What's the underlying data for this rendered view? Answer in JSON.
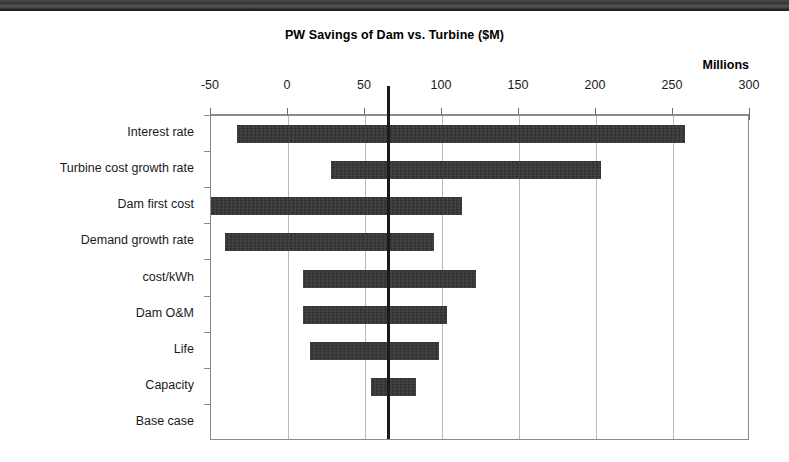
{
  "chart_data": {
    "type": "bar",
    "subtype": "tornado",
    "title": "PW Savings of Dam vs. Turbine  ($M)",
    "units_label": "Millions",
    "xlabel": "",
    "ylabel": "",
    "xlim": [
      -50,
      300
    ],
    "xticks": [
      -50,
      0,
      50,
      100,
      150,
      200,
      250,
      300
    ],
    "xtick_labels": [
      "-50",
      "0",
      "50",
      "100",
      "150",
      "200",
      "250",
      "300"
    ],
    "grid": true,
    "grid_axis": "x",
    "legend": false,
    "base_case_value": 65,
    "bar_color": "#2b2b2b",
    "categories": [
      "Interest rate",
      "Turbine cost growth rate",
      "Dam first cost",
      "Demand growth rate",
      "cost/kWh",
      "Dam O&M",
      "Life",
      "Capacity",
      "Base case"
    ],
    "bars": [
      {
        "category": "Interest rate",
        "low": -33,
        "high": 258
      },
      {
        "category": "Turbine cost growth rate",
        "low": 28,
        "high": 203
      },
      {
        "category": "Dam first cost",
        "low": -50,
        "high": 113
      },
      {
        "category": "Demand growth rate",
        "low": -41,
        "high": 95
      },
      {
        "category": "cost/kWh",
        "low": 10,
        "high": 122
      },
      {
        "category": "Dam O&M",
        "low": 10,
        "high": 103
      },
      {
        "category": "Life",
        "low": 14,
        "high": 98
      },
      {
        "category": "Capacity",
        "low": 54,
        "high": 83
      },
      {
        "category": "Base case",
        "low": 65,
        "high": 65
      }
    ]
  }
}
